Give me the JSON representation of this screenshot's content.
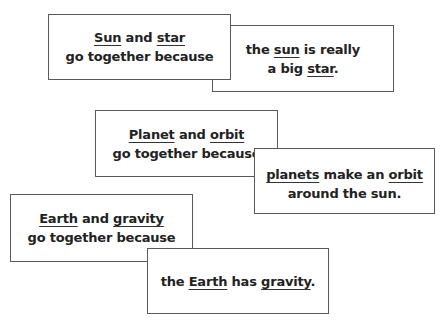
{
  "cards": [
    {
      "id": "card-1",
      "role": "prompt",
      "line1": {
        "kw1": "Sun",
        "mid": " and ",
        "kw2": "star"
      },
      "line2": "go together because"
    },
    {
      "id": "card-2",
      "role": "answer",
      "line1": {
        "pre": "the ",
        "kw1": "sun",
        "post": " is really"
      },
      "line2": {
        "pre": "a big ",
        "kw2": "star",
        "post": "."
      }
    },
    {
      "id": "card-3",
      "role": "prompt",
      "line1": {
        "kw1": "Planet",
        "mid": " and ",
        "kw2": "orbit"
      },
      "line2": "go together because"
    },
    {
      "id": "card-4",
      "role": "answer",
      "line1": {
        "kw1": "planets",
        "mid": " make an ",
        "kw2": "orbit"
      },
      "line2": "around the sun."
    },
    {
      "id": "card-5",
      "role": "prompt",
      "line1": {
        "kw1": "Earth",
        "mid": " and ",
        "kw2": "gravity"
      },
      "line2": "go together because"
    },
    {
      "id": "card-6",
      "role": "answer",
      "line1": {
        "pre": "the ",
        "kw1": "Earth",
        "mid": " has ",
        "kw2": "gravity",
        "post": "."
      }
    }
  ],
  "colors": {
    "text": "#222222",
    "border": "#5a5a5a",
    "background": "#ffffff"
  }
}
